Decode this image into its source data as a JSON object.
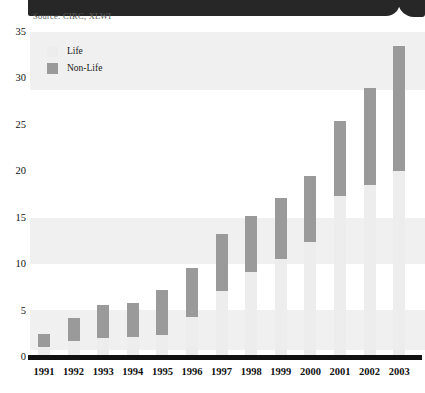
{
  "header": {
    "source_note": "Source: CIRC, XLWI",
    "corner_icon": "circle-badge-icon"
  },
  "legend": {
    "position": "top-left-inside",
    "items": [
      {
        "label": "Life",
        "color": "#ededed",
        "swatch_icon": "legend-swatch-life"
      },
      {
        "label": "Non-Life",
        "color": "#9a9a9a",
        "swatch_icon": "legend-swatch-non-life"
      }
    ]
  },
  "axes": {
    "y_ticks": [
      "35",
      "30",
      "25",
      "20",
      "15",
      "10",
      "5",
      "0"
    ],
    "x_ticks": [
      "1991",
      "1992",
      "1993",
      "1994",
      "1995",
      "1996",
      "1997",
      "1998",
      "1999",
      "2000",
      "2001",
      "2002",
      "2003"
    ]
  },
  "colors": {
    "life": "#ededed",
    "non_life": "#9a9a9a",
    "header_bar": "#272727",
    "background_band": "#f0f0f0",
    "axis": "#111111",
    "source_text": "#5d5d5d"
  },
  "chart_data": {
    "type": "bar",
    "stacked": true,
    "title": "",
    "subtitle": "",
    "xlabel": "",
    "ylabel": "",
    "ylim": [
      0,
      35
    ],
    "ytick_step": 5,
    "grid": false,
    "legend_position": "top-left-inside",
    "categories": [
      "1991",
      "1992",
      "1993",
      "1994",
      "1995",
      "1996",
      "1997",
      "1998",
      "1999",
      "2000",
      "2001",
      "2002",
      "2003"
    ],
    "series": [
      {
        "name": "Life",
        "color": "#ededed",
        "values": [
          1.1,
          1.7,
          2.1,
          2.2,
          2.4,
          4.3,
          7.1,
          9.2,
          10.6,
          12.4,
          17.3,
          18.5,
          20.0
        ]
      },
      {
        "name": "Non-Life",
        "color": "#9a9a9a",
        "values": [
          1.4,
          2.5,
          3.5,
          3.6,
          4.8,
          5.3,
          6.2,
          6.0,
          6.5,
          7.1,
          8.1,
          10.5,
          13.5
        ]
      }
    ],
    "totals": [
      2.5,
      4.2,
      5.6,
      5.8,
      7.2,
      9.6,
      13.3,
      15.2,
      17.1,
      19.5,
      25.4,
      29.0,
      33.5
    ]
  }
}
